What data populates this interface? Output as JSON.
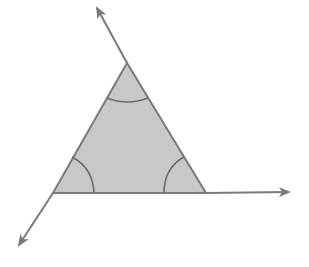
{
  "diagram": {
    "colors": {
      "line": "#7a7a7a",
      "fill": "#c8c8c8",
      "arc": "#6a6a6a",
      "background": "#ffffff"
    },
    "triangle": {
      "vertices": {
        "top": [
          127,
          63
        ],
        "bottom_left": [
          53,
          193
        ],
        "bottom_right": [
          206,
          193
        ]
      }
    },
    "rays": [
      {
        "name": "ray-up-left",
        "from": [
          127,
          63
        ],
        "to": [
          96,
          6
        ]
      },
      {
        "name": "ray-right",
        "from": [
          206,
          193
        ],
        "to": [
          290,
          192
        ]
      },
      {
        "name": "ray-down-left",
        "from": [
          53,
          193
        ],
        "to": [
          18,
          247
        ]
      }
    ],
    "angle_arcs": [
      "top",
      "bottom_left",
      "bottom_right"
    ]
  }
}
